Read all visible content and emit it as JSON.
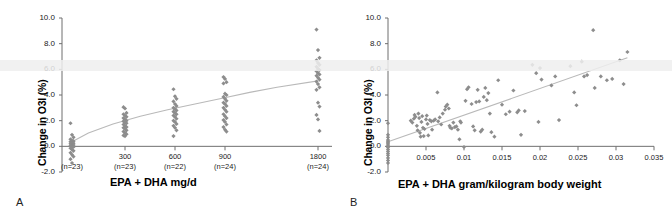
{
  "figure": {
    "panel_a_letter": "A",
    "panel_b_letter": "B"
  },
  "chart_data": [
    {
      "type": "scatter",
      "panel": "A",
      "title": "",
      "xlabel": "EPA + DHA mg/d",
      "ylabel": "Change in O3I (%)",
      "ylim": [
        -2.0,
        10.0
      ],
      "yticks": [
        "10.0",
        "8.0",
        "6.0",
        "4.0",
        "2.0",
        "0.0",
        "-2.0"
      ],
      "ytick_values": [
        10.0,
        8.0,
        6.0,
        4.0,
        2.0,
        0.0,
        -2.0
      ],
      "grid": false,
      "legend": "none",
      "xtick_labels": [
        "",
        "300",
        "600",
        "900",
        "1800"
      ],
      "xtick_values": [
        0,
        300,
        600,
        900,
        1800
      ],
      "group_counts": [
        "(n=23)",
        "(n=23)",
        "(n=22)",
        "(n=24)",
        "(n=24)"
      ],
      "fit_type": "logarithmic",
      "fit_description": "saturating log dose-response curve rising from ~0.4% at 0 mg/d to ~5.1% at 1800 mg/d",
      "fit_points": [
        [
          0,
          0.35
        ],
        [
          120,
          1.05
        ],
        [
          300,
          1.75
        ],
        [
          500,
          2.35
        ],
        [
          700,
          2.85
        ],
        [
          900,
          3.3
        ],
        [
          1100,
          3.75
        ],
        [
          1300,
          4.2
        ],
        [
          1500,
          4.6
        ],
        [
          1800,
          5.1
        ]
      ],
      "series": [
        {
          "name": "0 mg/d (placebo)",
          "x": 0,
          "values": [
            1.8,
            0.9,
            0.7,
            0.55,
            0.45,
            0.4,
            0.35,
            0.3,
            0.25,
            0.2,
            0.15,
            0.1,
            0.05,
            0.0,
            -0.05,
            -0.15,
            -0.25,
            -0.35,
            -0.5,
            -0.65,
            -0.8,
            -1.0,
            -1.3
          ]
        },
        {
          "name": "300 mg/d",
          "x": 300,
          "values": [
            3.05,
            2.95,
            2.6,
            2.5,
            2.4,
            2.3,
            2.2,
            2.1,
            2.0,
            1.95,
            1.85,
            1.8,
            1.7,
            1.6,
            1.5,
            1.45,
            1.35,
            1.25,
            1.15,
            1.05,
            0.95,
            0.85,
            0.8
          ]
        },
        {
          "name": "600 mg/d",
          "x": 600,
          "values": [
            4.45,
            3.9,
            3.7,
            3.5,
            3.3,
            3.15,
            3.0,
            2.9,
            2.8,
            2.7,
            2.6,
            2.5,
            2.4,
            2.3,
            2.15,
            2.0,
            1.9,
            1.75,
            1.6,
            1.45,
            1.25,
            0.8
          ]
        },
        {
          "name": "900 mg/d",
          "x": 900,
          "values": [
            5.4,
            5.25,
            5.0,
            4.9,
            4.1,
            4.0,
            3.85,
            3.7,
            3.55,
            3.4,
            3.3,
            3.15,
            3.0,
            2.85,
            2.7,
            2.5,
            2.35,
            2.2,
            2.05,
            1.9,
            1.7,
            1.5,
            1.3,
            1.15
          ]
        },
        {
          "name": "1800 mg/d",
          "x": 1800,
          "values": [
            9.1,
            7.5,
            6.9,
            6.7,
            6.5,
            6.35,
            6.2,
            6.05,
            5.95,
            5.85,
            5.7,
            5.6,
            5.5,
            5.35,
            5.2,
            5.05,
            4.85,
            4.6,
            4.4,
            3.4,
            3.1,
            2.45,
            2.1,
            1.2
          ]
        }
      ]
    },
    {
      "type": "scatter",
      "panel": "B",
      "title": "",
      "xlabel": "EPA + DHA gram/kilogram body weight",
      "ylabel": "Change in O3I (%)",
      "xlim": [
        0,
        0.035
      ],
      "ylim": [
        -2.0,
        10.0
      ],
      "xticks": [
        "0.005",
        "0.01",
        "0.015",
        "0.02",
        "0.025",
        "0.03",
        "0.035"
      ],
      "xtick_values": [
        0.005,
        0.01,
        0.015,
        0.02,
        0.025,
        0.03,
        0.035
      ],
      "yticks": [
        "10.0",
        "8.0",
        "6.0",
        "4.0",
        "2.0",
        "0.0",
        "-2.0"
      ],
      "ytick_values": [
        10.0,
        8.0,
        6.0,
        4.0,
        2.0,
        0.0,
        -2.0
      ],
      "grid": false,
      "legend": "none",
      "fit_type": "linear",
      "fit_description": "linear regression from ~0.35% at x=0 to ~6.9% at x=0.0315",
      "fit_points": [
        [
          0,
          0.35
        ],
        [
          0.0315,
          6.9
        ]
      ],
      "points": [
        [
          0.0,
          1.8
        ],
        [
          0.0,
          0.9
        ],
        [
          0.0,
          0.7
        ],
        [
          0.0,
          0.5
        ],
        [
          0.0,
          0.4
        ],
        [
          0.0,
          0.3
        ],
        [
          0.0,
          0.2
        ],
        [
          0.0,
          0.1
        ],
        [
          0.0,
          0.0
        ],
        [
          0.0,
          -0.1
        ],
        [
          0.0,
          -0.25
        ],
        [
          0.0,
          -0.4
        ],
        [
          0.0,
          -0.55
        ],
        [
          0.0,
          -0.7
        ],
        [
          0.0,
          -0.9
        ],
        [
          0.0,
          -1.1
        ],
        [
          0.0,
          -1.3
        ],
        [
          0.003,
          2.0
        ],
        [
          0.0032,
          1.85
        ],
        [
          0.0034,
          2.15
        ],
        [
          0.0035,
          2.45
        ],
        [
          0.0036,
          2.3
        ],
        [
          0.0038,
          1.6
        ],
        [
          0.0039,
          1.25
        ],
        [
          0.004,
          2.55
        ],
        [
          0.0041,
          2.2
        ],
        [
          0.0042,
          1.05
        ],
        [
          0.0043,
          0.75
        ],
        [
          0.0044,
          1.9
        ],
        [
          0.0045,
          2.35
        ],
        [
          0.0046,
          1.45
        ],
        [
          0.0047,
          0.8
        ],
        [
          0.0048,
          1.35
        ],
        [
          0.005,
          2.1
        ],
        [
          0.0051,
          2.4
        ],
        [
          0.0052,
          1.75
        ],
        [
          0.0053,
          0.85
        ],
        [
          0.0055,
          2.05
        ],
        [
          0.0057,
          1.95
        ],
        [
          0.0058,
          1.3
        ],
        [
          0.006,
          2.0
        ],
        [
          0.0062,
          2.1
        ],
        [
          0.0065,
          4.2
        ],
        [
          0.0066,
          1.95
        ],
        [
          0.0068,
          2.25
        ],
        [
          0.007,
          1.7
        ],
        [
          0.0072,
          2.55
        ],
        [
          0.0075,
          2.85
        ],
        [
          0.0076,
          3.1
        ],
        [
          0.0078,
          3.25
        ],
        [
          0.008,
          2.95
        ],
        [
          0.0081,
          1.6
        ],
        [
          0.0082,
          1.45
        ],
        [
          0.0084,
          1.4
        ],
        [
          0.0086,
          1.85
        ],
        [
          0.0088,
          1.5
        ],
        [
          0.009,
          1.55
        ],
        [
          0.0092,
          1.3
        ],
        [
          0.0094,
          0.55
        ],
        [
          0.0095,
          1.95
        ],
        [
          0.0096,
          1.85
        ],
        [
          0.01,
          -0.05
        ],
        [
          0.0102,
          3.55
        ],
        [
          0.0104,
          4.45
        ],
        [
          0.0106,
          4.6
        ],
        [
          0.011,
          3.3
        ],
        [
          0.0112,
          1.55
        ],
        [
          0.0114,
          1.25
        ],
        [
          0.0116,
          3.45
        ],
        [
          0.0118,
          4.4
        ],
        [
          0.012,
          3.5
        ],
        [
          0.0122,
          1.15
        ],
        [
          0.0124,
          1.3
        ],
        [
          0.0126,
          3.85
        ],
        [
          0.0128,
          4.55
        ],
        [
          0.013,
          3.6
        ],
        [
          0.0132,
          4.15
        ],
        [
          0.0134,
          2.55
        ],
        [
          0.0136,
          1.1
        ],
        [
          0.014,
          0.75
        ],
        [
          0.0145,
          5.15
        ],
        [
          0.015,
          3.25
        ],
        [
          0.0155,
          2.5
        ],
        [
          0.016,
          2.7
        ],
        [
          0.0165,
          4.35
        ],
        [
          0.017,
          2.65
        ],
        [
          0.0172,
          2.8
        ],
        [
          0.0175,
          0.9
        ],
        [
          0.018,
          2.75
        ],
        [
          0.019,
          6.35
        ],
        [
          0.0195,
          5.7
        ],
        [
          0.0198,
          1.9
        ],
        [
          0.02,
          6.1
        ],
        [
          0.0202,
          5.2
        ],
        [
          0.0215,
          4.75
        ],
        [
          0.022,
          5.45
        ],
        [
          0.0225,
          2.05
        ],
        [
          0.024,
          6.25
        ],
        [
          0.0245,
          4.2
        ],
        [
          0.0248,
          3.2
        ],
        [
          0.0255,
          6.6
        ],
        [
          0.0258,
          5.45
        ],
        [
          0.0262,
          5.55
        ],
        [
          0.027,
          9.05
        ],
        [
          0.0272,
          4.55
        ],
        [
          0.028,
          5.45
        ],
        [
          0.0288,
          5.15
        ],
        [
          0.0295,
          5.25
        ],
        [
          0.0305,
          6.7
        ],
        [
          0.031,
          4.85
        ],
        [
          0.0315,
          7.35
        ]
      ]
    }
  ]
}
